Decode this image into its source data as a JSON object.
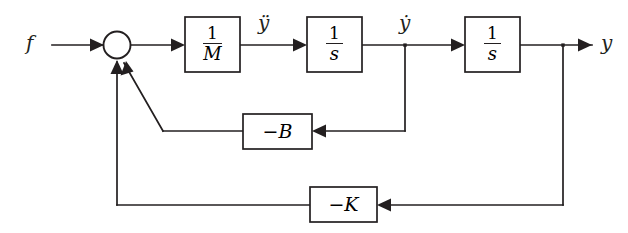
{
  "diagram": {
    "stroke_color": "#231f20",
    "background_color": "#ffffff",
    "signals": {
      "input": "f",
      "acceleration": "ÿ",
      "velocity": "ẏ",
      "position": "y"
    },
    "summing_junction": {
      "name": "summing-junction",
      "shape": "circle",
      "input_count": 3
    },
    "blocks": [
      {
        "id": "plant-gain",
        "numerator": "1",
        "denominator": "M",
        "label": "1/M"
      },
      {
        "id": "integrator-1",
        "numerator": "1",
        "denominator": "s",
        "label": "1/s"
      },
      {
        "id": "integrator-2",
        "numerator": "1",
        "denominator": "s",
        "label": "1/s"
      },
      {
        "id": "damping-gain",
        "label": "−B"
      },
      {
        "id": "spring-gain",
        "label": "−K"
      }
    ],
    "feedback_paths": [
      {
        "id": "velocity-feedback",
        "gain": "−B",
        "from": "ẏ",
        "to": "summing-junction"
      },
      {
        "id": "position-feedback",
        "gain": "−K",
        "from": "y",
        "to": "summing-junction"
      }
    ]
  }
}
